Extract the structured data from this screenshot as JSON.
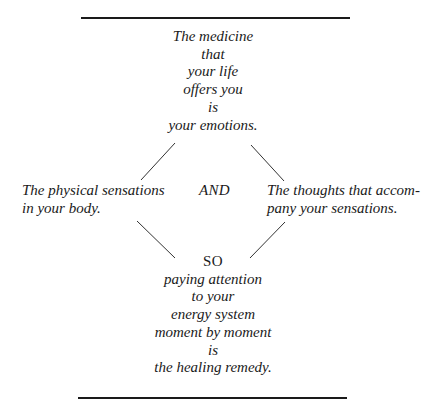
{
  "top_block": {
    "lines": [
      "The medicine",
      "that",
      "your life",
      "offers you",
      "is",
      "your emotions."
    ]
  },
  "left_node": {
    "lines": [
      "The physical sensations",
      "in your body."
    ]
  },
  "connector": "AND",
  "right_node": {
    "lines": [
      "The thoughts that accom-",
      "pany your sensations."
    ]
  },
  "bottom_block": {
    "heading": "SO",
    "lines": [
      "paying attention",
      "to your",
      "energy system",
      "moment by moment",
      "is",
      "the healing remedy."
    ]
  },
  "colors": {
    "text": "#1a1a1a",
    "background": "#ffffff"
  }
}
